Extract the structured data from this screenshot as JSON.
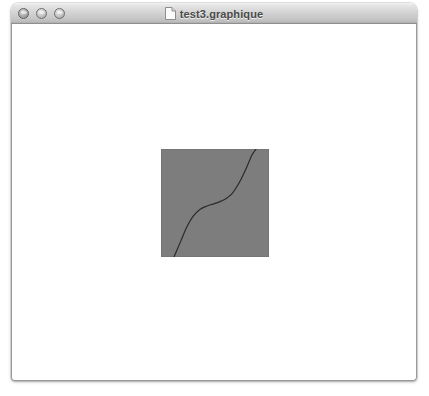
{
  "window": {
    "title": "test3.graphique",
    "title_icon": "document-icon",
    "state": "inactive",
    "controls": [
      {
        "name": "close",
        "label": "Close",
        "icon": "close-button"
      },
      {
        "name": "minimize",
        "label": "Minimize",
        "icon": "minimize-button"
      },
      {
        "name": "zoom",
        "label": "Zoom",
        "icon": "zoom-button"
      }
    ]
  },
  "colors": {
    "titlebar_top": "#f2f2f2",
    "titlebar_bottom": "#a9a9a9",
    "title_text": "#4a4a4a",
    "window_border": "#9a9a9a",
    "canvas_background": "#ffffff",
    "plot_fill": "#7d7d7d",
    "plot_border": "#6f6f6f",
    "curve_stroke": "#2b2b2b"
  },
  "canvas": {
    "background": "#ffffff",
    "graphic": {
      "name": "s-curve-plot",
      "shape": "square",
      "fill": "#7d7d7d",
      "width": 108,
      "height": 108,
      "x": 149,
      "y": 125
    }
  },
  "chart_data": {
    "type": "line",
    "title": "",
    "subtitle": "",
    "xlabel": "",
    "ylabel": "",
    "grid": false,
    "legend": null,
    "axes_visible": false,
    "tick_labels_x": [],
    "tick_labels_y": [],
    "xlim": [
      0,
      1
    ],
    "ylim": [
      0,
      1
    ],
    "background_fill": "#7d7d7d",
    "series": [
      {
        "name": "cubic-s-curve",
        "color": "#2b2b2b",
        "linewidth": 1,
        "x": [
          0.12,
          0.18,
          0.24,
          0.3,
          0.36,
          0.42,
          0.48,
          0.54,
          0.6,
          0.66,
          0.72,
          0.78,
          0.84,
          0.88
        ],
        "y": [
          0.0,
          0.14,
          0.28,
          0.38,
          0.44,
          0.47,
          0.49,
          0.51,
          0.54,
          0.59,
          0.68,
          0.8,
          0.94,
          1.0
        ]
      }
    ],
    "annotations": []
  }
}
